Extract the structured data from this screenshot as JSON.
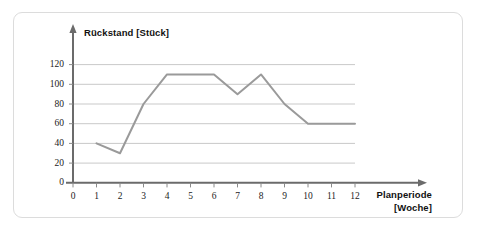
{
  "chart_data": {
    "type": "line",
    "title": "",
    "ylabel": "Rückstand [Stück]",
    "xlabel": "Planperiode [Woche]",
    "xlabel_line1": "Planperiode",
    "xlabel_line2": "[Woche]",
    "x": [
      1,
      2,
      3,
      4,
      5,
      6,
      7,
      8,
      9,
      10,
      11,
      12
    ],
    "values": [
      40,
      30,
      80,
      110,
      110,
      110,
      90,
      110,
      80,
      60,
      60,
      60
    ],
    "series": [
      {
        "name": "Rückstand",
        "values": [
          40,
          30,
          80,
          110,
          110,
          110,
          90,
          110,
          80,
          60,
          60,
          60
        ]
      }
    ],
    "xticks": [
      "0",
      "1",
      "2",
      "3",
      "4",
      "5",
      "6",
      "7",
      "8",
      "9",
      "10",
      "11",
      "12"
    ],
    "xtick_values": [
      0,
      1,
      2,
      3,
      4,
      5,
      6,
      7,
      8,
      9,
      10,
      11,
      12
    ],
    "yticks": [
      "0",
      "20",
      "40",
      "60",
      "80",
      "100",
      "120"
    ],
    "ytick_values": [
      0,
      20,
      40,
      60,
      80,
      100,
      120
    ],
    "xlim": [
      0,
      12
    ],
    "ylim": [
      0,
      130
    ],
    "grid": true,
    "grid_axis": "y",
    "legend": false,
    "legend_position": "none",
    "line_color": "#9a9a9a",
    "grid_color": "#c9c9c9",
    "axis_color": "#5a5a5a",
    "text_color": "#111111",
    "panel_border_color": "#dcdcdc",
    "background_color": "#ffffff"
  }
}
